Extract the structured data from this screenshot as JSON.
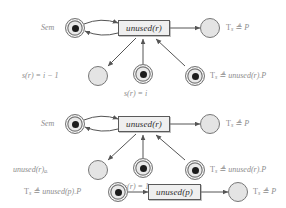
{
  "diagram": {
    "type": "petri-net",
    "title": "",
    "rows": [
      {
        "id": "row-1",
        "transition": {
          "label": "unused(r)"
        },
        "places": [
          {
            "id": "sem-place-1",
            "label": "Sem",
            "tokens": 1,
            "shape": "double-ring"
          },
          {
            "id": "result-place-1",
            "label": "T_s ≜ P",
            "tokens": 0,
            "shape": "circle"
          },
          {
            "id": "sr-minus-place-1",
            "label": "s(r) = i − 1",
            "tokens": 0,
            "shape": "circle"
          },
          {
            "id": "sr-place-1",
            "label": "s(r) = i",
            "tokens": 1,
            "shape": "double-ring"
          },
          {
            "id": "thread-place-1",
            "label": "T_s ≜ unused(r).P",
            "tokens": 1,
            "shape": "double-ring"
          }
        ]
      },
      {
        "id": "row-2",
        "transition": {
          "label": "unused(r)"
        },
        "places": [
          {
            "id": "sem-place-2",
            "label": "Sem",
            "tokens": 1,
            "shape": "double-ring"
          },
          {
            "id": "result-place-2",
            "label": "T_s ≜ P",
            "tokens": 0,
            "shape": "circle"
          },
          {
            "id": "unused-ai-place",
            "label": "unused(r)a_i",
            "tokens": 0,
            "shape": "circle"
          },
          {
            "id": "sr-place-2",
            "label": "s(r) = 1",
            "tokens": 1,
            "shape": "double-ring"
          },
          {
            "id": "thread-place-2",
            "label": "T_s ≜ unused(r).P",
            "tokens": 1,
            "shape": "double-ring"
          }
        ]
      },
      {
        "id": "row-3",
        "transition": {
          "label": "unused(p)"
        },
        "places": [
          {
            "id": "thread-place-3",
            "label": "T_s ≜ unused(p).P",
            "tokens": 1,
            "shape": "double-ring"
          },
          {
            "id": "result-place-3",
            "label": "T_s ≜ P",
            "tokens": 0,
            "shape": "circle"
          }
        ]
      }
    ],
    "labels": {
      "sem_1": "Sem",
      "result_1": "T",
      "result_1_sub": "s",
      "result_1_tail": "≜ P",
      "sr_minus_1_a": "s(r) = i − 1",
      "sr_1": "s(r) = i",
      "thread_1_head": "T",
      "thread_1_sub": "s",
      "thread_1_tail": "≜ unused(r).P",
      "sem_2": "Sem",
      "unused_ai_head": "unused(r)",
      "unused_ai_sub": "aᵢ",
      "sr_2": "s(r) = 1",
      "thread_3_head": "T",
      "thread_3_sub": "s",
      "thread_3_tail": "≜ unused(p).P",
      "transition_r": "unused(r)",
      "transition_p": "unused(p)"
    },
    "colors": {
      "place_fill": "#e9e9e9",
      "place_stroke": "#777777",
      "transition_fill": "#efefef",
      "transition_stroke": "#5a5a5a",
      "token": "#1c1c1c",
      "arc": "#555555",
      "label_text": "#8d8d8d",
      "background": "#ffffff"
    }
  }
}
